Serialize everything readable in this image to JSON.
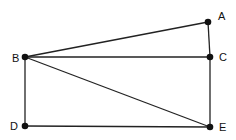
{
  "diagram": {
    "type": "geometry-figure",
    "points": [
      {
        "id": "A",
        "label": "A",
        "x": 208,
        "y": 22,
        "lx": 218,
        "ly": 20
      },
      {
        "id": "B",
        "label": "B",
        "x": 25,
        "y": 57,
        "lx": 12,
        "ly": 62
      },
      {
        "id": "C",
        "label": "C",
        "x": 210,
        "y": 57,
        "lx": 219,
        "ly": 61
      },
      {
        "id": "D",
        "label": "D",
        "x": 25,
        "y": 126,
        "lx": 10,
        "ly": 130
      },
      {
        "id": "E",
        "label": "E",
        "x": 210,
        "y": 127,
        "lx": 219,
        "ly": 131
      }
    ],
    "segments": [
      [
        "B",
        "A"
      ],
      [
        "A",
        "C"
      ],
      [
        "B",
        "C"
      ],
      [
        "C",
        "E"
      ],
      [
        "B",
        "E"
      ],
      [
        "B",
        "D"
      ],
      [
        "D",
        "E"
      ]
    ],
    "colors": {
      "line": "#222222",
      "point": "#111111",
      "background": "#ffffff"
    }
  }
}
